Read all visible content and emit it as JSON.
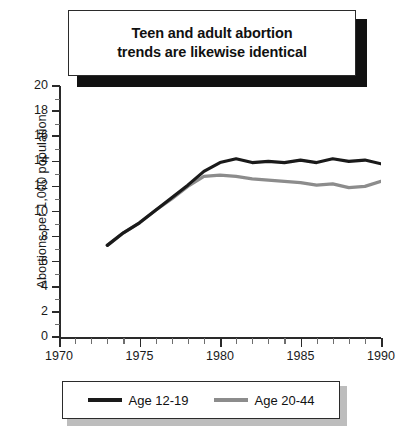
{
  "title": {
    "line1": "Teen and adult abortion",
    "line2": "trends are likewise identical",
    "full": "Teen and adult abortion trends are likewise identical"
  },
  "legend": {
    "position": "bottom",
    "entries": [
      {
        "label": "Age 12-19",
        "color": "#1a1a1a"
      },
      {
        "label": "Age 20-44",
        "color": "#8c8c8c"
      }
    ]
  },
  "axes": {
    "y_title": "Abortions per 1,000 population",
    "y_ticks": [
      "0",
      "2",
      "4",
      "6",
      "8",
      "10",
      "12",
      "14",
      "16",
      "18",
      "20"
    ],
    "x_ticks": [
      "1970",
      "1975",
      "1980",
      "1985",
      "1990"
    ]
  },
  "chart_data": {
    "type": "line",
    "title": "Teen and adult abortion trends are likewise identical",
    "xlabel": "",
    "ylabel": "Abortions per 1,000 population",
    "xlim": [
      1970,
      1990
    ],
    "ylim": [
      0,
      20
    ],
    "ytick_step": 2,
    "xtick_step": 5,
    "x_minor_tick_step": 1,
    "grid": false,
    "legend_position": "bottom",
    "x": [
      1973,
      1974,
      1975,
      1976,
      1977,
      1978,
      1979,
      1980,
      1981,
      1982,
      1983,
      1984,
      1985,
      1986,
      1987,
      1988,
      1989,
      1990
    ],
    "series": [
      {
        "name": "Age 12-19",
        "color": "#1a1a1a",
        "values": [
          7.3,
          8.3,
          9.1,
          10.1,
          11.1,
          12.1,
          13.2,
          13.9,
          14.2,
          13.9,
          14.0,
          13.9,
          14.1,
          13.9,
          14.2,
          14.0,
          14.1,
          13.8
        ]
      },
      {
        "name": "Age 20-44",
        "color": "#8c8c8c",
        "values": [
          7.3,
          8.3,
          9.1,
          10.1,
          11.0,
          12.0,
          12.8,
          12.9,
          12.8,
          12.6,
          12.5,
          12.4,
          12.3,
          12.1,
          12.2,
          11.9,
          12.0,
          12.4
        ]
      }
    ]
  }
}
